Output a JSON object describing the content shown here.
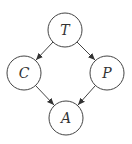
{
  "diagram": {
    "type": "directed-graph",
    "nodes": [
      {
        "id": "T",
        "label": "T",
        "cx": 65,
        "cy": 30
      },
      {
        "id": "C",
        "label": "C",
        "cx": 24,
        "cy": 73
      },
      {
        "id": "P",
        "label": "P",
        "cx": 107,
        "cy": 73
      },
      {
        "id": "A",
        "label": "A",
        "cx": 66,
        "cy": 118
      }
    ],
    "edges": [
      {
        "from": "T",
        "to": "C"
      },
      {
        "from": "T",
        "to": "P"
      },
      {
        "from": "C",
        "to": "A"
      },
      {
        "from": "P",
        "to": "A"
      }
    ],
    "colors": {
      "stroke": "#444444",
      "fill": "#ffffff"
    }
  }
}
